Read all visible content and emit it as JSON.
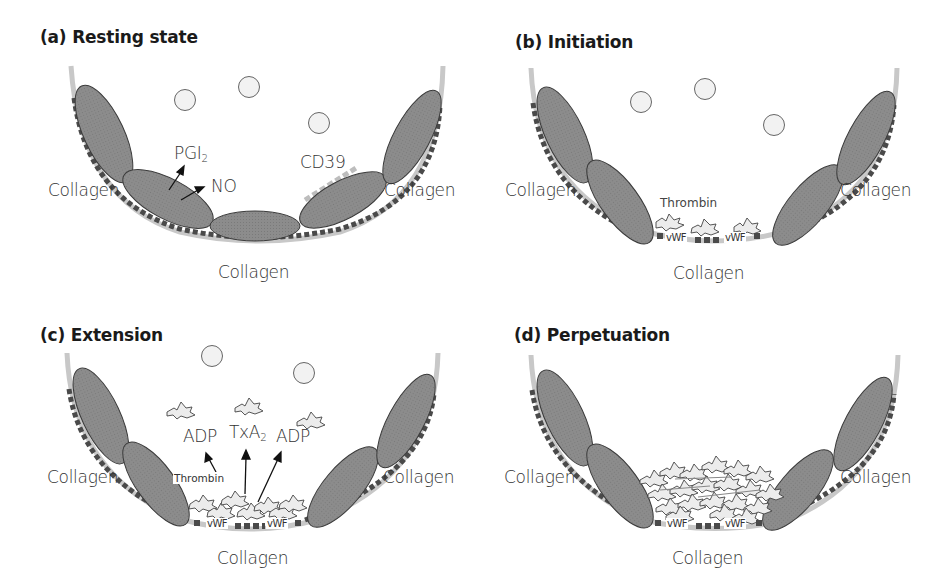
{
  "colors": {
    "endothelial_cell": "#8c8c8c",
    "cell_outline": "#3a3a3a",
    "vessel_wall": "#c8c8c8",
    "collagen_dashes": "#4a4a4a",
    "cd39_dashes": "#bdbdbd",
    "rbc_fill": "#f2f2f2",
    "platelet_fill": "#ececec",
    "text": "#333333"
  },
  "panels": {
    "a": {
      "title": "(a) Resting state",
      "labels": {
        "collagen_left": "Collagen",
        "collagen_right": "Collagen",
        "collagen_bottom": "Collagen",
        "pgi2": "PGI",
        "pgi2_sub": "2",
        "no": "NO",
        "cd39": "CD39"
      }
    },
    "b": {
      "title": "(b) Initiation",
      "labels": {
        "collagen_left": "Collagen",
        "collagen_right": "Collagen",
        "collagen_bottom": "Collagen",
        "thrombin": "Thrombin",
        "vwf_1": "vWF",
        "vwf_2": "vWF"
      }
    },
    "c": {
      "title": "(c)  Extension",
      "labels": {
        "collagen_left": "Collagen",
        "collagen_right": "Collagen",
        "collagen_bottom": "Collagen",
        "adp_left": "ADP",
        "txa2": "TxA",
        "txa2_sub": "2",
        "adp_right": "ADP",
        "thrombin": "Thrombin",
        "vwf_1": "vWF",
        "vwf_2": "vWF"
      }
    },
    "d": {
      "title": "(d) Perpetuation",
      "labels": {
        "collagen_left": "Collagen",
        "collagen_right": "Collagen",
        "collagen_bottom": "Collagen",
        "vwf_1": "vWF",
        "vwf_2": "vWF"
      }
    }
  }
}
